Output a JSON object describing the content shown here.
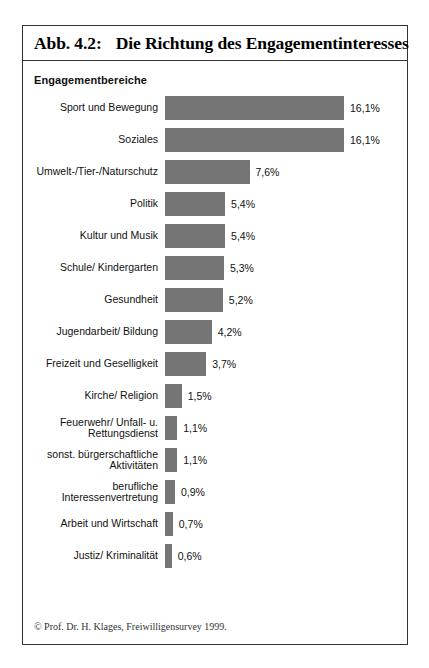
{
  "figure": {
    "title_number": "Abb. 4.2:",
    "title_text": "Die Richtung des Engagementinteresses",
    "axis_heading": "Engagementbereiche",
    "credit": "© Prof. Dr. H. Klages, Freiwilligensurvey 1999."
  },
  "chart_data": {
    "type": "bar",
    "orientation": "horizontal",
    "title": "Die Richtung des Engagementinteresses",
    "xlabel": "",
    "ylabel": "Engagementbereiche",
    "xlim": [
      0,
      16.1
    ],
    "grid": false,
    "legend": "none",
    "value_suffix": "%",
    "decimal_separator": ",",
    "bar_color": "#757575",
    "categories": [
      "Sport und Bewegung",
      "Soziales",
      "Umwelt-/Tier-/Naturschutz",
      "Politik",
      "Kultur und Musik",
      "Schule/ Kindergarten",
      "Gesundheit",
      "Jugendarbeit/ Bildung",
      "Freizeit und Geselligkeit",
      "Kirche/ Religion",
      "Feuerwehr/ Unfall- u. Rettungsdienst",
      "sonst. bürgerschaftliche Aktivitäten",
      "berufliche Interessenvertretung",
      "Arbeit und Wirtschaft",
      "Justiz/ Kriminalität"
    ],
    "values": [
      16.1,
      16.1,
      7.6,
      5.4,
      5.4,
      5.3,
      5.2,
      4.2,
      3.7,
      1.5,
      1.1,
      1.1,
      0.9,
      0.7,
      0.6
    ],
    "value_labels": [
      "16,1%",
      "16,1%",
      "7,6%",
      "5,4%",
      "5,4%",
      "5,3%",
      "5,2%",
      "4,2%",
      "3,7%",
      "1,5%",
      "1,1%",
      "1,1%",
      "0,9%",
      "0,7%",
      "0,6%"
    ]
  },
  "rows": [
    {
      "label_line1": "Sport und Bewegung",
      "label_line2": "",
      "value_label": "16,1%",
      "value": 16.1
    },
    {
      "label_line1": "Soziales",
      "label_line2": "",
      "value_label": "16,1%",
      "value": 16.1
    },
    {
      "label_line1": "Umwelt-/Tier-/Naturschutz",
      "label_line2": "",
      "value_label": "7,6%",
      "value": 7.6
    },
    {
      "label_line1": "Politik",
      "label_line2": "",
      "value_label": "5,4%",
      "value": 5.4
    },
    {
      "label_line1": "Kultur und Musik",
      "label_line2": "",
      "value_label": "5,4%",
      "value": 5.4
    },
    {
      "label_line1": "Schule/ Kindergarten",
      "label_line2": "",
      "value_label": "5,3%",
      "value": 5.3
    },
    {
      "label_line1": "Gesundheit",
      "label_line2": "",
      "value_label": "5,2%",
      "value": 5.2
    },
    {
      "label_line1": "Jugendarbeit/ Bildung",
      "label_line2": "",
      "value_label": "4,2%",
      "value": 4.2
    },
    {
      "label_line1": "Freizeit und Geselligkeit",
      "label_line2": "",
      "value_label": "3,7%",
      "value": 3.7
    },
    {
      "label_line1": "Kirche/ Religion",
      "label_line2": "",
      "value_label": "1,5%",
      "value": 1.5
    },
    {
      "label_line1": "Feuerwehr/ Unfall- u.",
      "label_line2": "Rettungsdienst",
      "value_label": "1,1%",
      "value": 1.1
    },
    {
      "label_line1": "sonst. bürgerschaftliche",
      "label_line2": "Aktivitäten",
      "value_label": "1,1%",
      "value": 1.1
    },
    {
      "label_line1": "berufliche",
      "label_line2": "Interessenvertretung",
      "value_label": "0,9%",
      "value": 0.9
    },
    {
      "label_line1": "Arbeit und Wirtschaft",
      "label_line2": "",
      "value_label": "0,7%",
      "value": 0.7
    },
    {
      "label_line1": "Justiz/ Kriminalität",
      "label_line2": "",
      "value_label": "0,6%",
      "value": 0.6
    }
  ],
  "scale": {
    "px_per_percent": 11.12
  }
}
